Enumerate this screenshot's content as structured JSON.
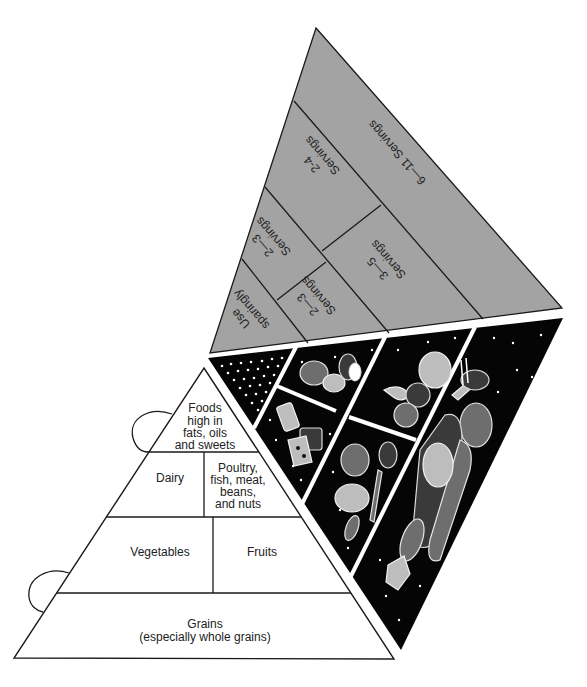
{
  "diagram": {
    "colors": {
      "servings_face": "#a3a3a3",
      "food_face": "#050505",
      "label_face": "#ffffff",
      "outline": "#1a1a1a"
    },
    "label_face": {
      "tiers": [
        {
          "id": "fats",
          "label_lines": [
            "Foods",
            "high in",
            "fats, oils",
            "and sweets"
          ]
        },
        {
          "id": "dairy",
          "label": "Dairy"
        },
        {
          "id": "protein",
          "label_lines": [
            "Poultry,",
            "fish, meat,",
            "beans,",
            "and nuts"
          ]
        },
        {
          "id": "vegetables",
          "label": "Vegetables"
        },
        {
          "id": "fruits",
          "label": "Fruits"
        },
        {
          "id": "grains",
          "label_lines": [
            "Grains",
            "(especially whole grains)"
          ]
        }
      ],
      "tabs": [
        "glue-tab-upper",
        "glue-tab-lower"
      ]
    },
    "servings_face": {
      "sections": [
        {
          "id": "grains",
          "label": "6—11 Servings"
        },
        {
          "id": "dairy",
          "label_lines": [
            "2-4",
            "Servings"
          ]
        },
        {
          "id": "fruits",
          "label_lines": [
            "3—5",
            "Servings"
          ]
        },
        {
          "id": "vegetables",
          "label_lines": [
            "2—3",
            "Servings"
          ]
        },
        {
          "id": "protein",
          "label_lines": [
            "2—3",
            "Servings"
          ]
        },
        {
          "id": "fats",
          "label_lines": [
            "Use",
            "sparingly"
          ]
        }
      ]
    },
    "food_face": {
      "panels": [
        {
          "id": "fats",
          "illustration": "dots-sugar-icon"
        },
        {
          "id": "protein",
          "illustration": "poultry-fish-nuts-icon"
        },
        {
          "id": "dairy",
          "illustration": "milk-cheese-icon"
        },
        {
          "id": "fruits",
          "illustration": "grapes-banana-apple-icon"
        },
        {
          "id": "vegetables",
          "illustration": "broccoli-lettuce-carrot-icon"
        },
        {
          "id": "grains",
          "illustration": "bread-rice-pasta-icon"
        }
      ]
    }
  }
}
